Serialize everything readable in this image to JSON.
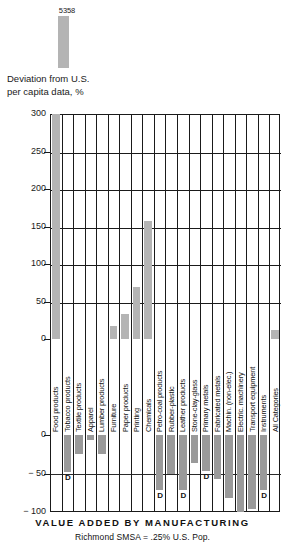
{
  "chart_data": {
    "type": "bar",
    "title": "VALUE ADDED BY MANUFACTURING",
    "subtitle": "Richmond SMSA  =  .25% U.S. Pop.",
    "ylabel_line1": "Deviation from U.S.",
    "ylabel_line2": "per capita data, %",
    "xlabel": "",
    "ylim": [
      -100,
      300
    ],
    "yticks_upper": [
      "300",
      "250",
      "200",
      "150",
      "100",
      "50",
      "0"
    ],
    "yticks_lower": [
      "0",
      "− 50",
      "− 100"
    ],
    "grid": true,
    "legend": "none",
    "overflow_annotation": {
      "category": "Food products",
      "value_label": "5358",
      "value": 5358
    },
    "footnote_symbol": "D",
    "categories": [
      "Food products",
      "Tobacco products",
      "Textile products",
      "Apparel",
      "Lumber products",
      "Furniture",
      "Paper products",
      "Printing",
      "Chemicals",
      "Petro-coal products",
      "Rubber-plastic",
      "Leather products",
      "Stone-clay-glass",
      "Primary metals",
      "Fabricated metals",
      "Machin. (non-elec.)",
      "Electric. machinery",
      "Transport equipment",
      "Instruments",
      "All Categories"
    ],
    "values": [
      5358,
      -48,
      -25,
      -7,
      -25,
      17,
      33,
      70,
      157,
      -72,
      -50,
      -72,
      -37,
      -47,
      -57,
      -82,
      -100,
      -96,
      -72,
      12
    ],
    "d_flags": [
      false,
      true,
      false,
      false,
      false,
      false,
      false,
      false,
      false,
      true,
      false,
      true,
      false,
      true,
      false,
      false,
      false,
      false,
      true,
      false
    ]
  }
}
